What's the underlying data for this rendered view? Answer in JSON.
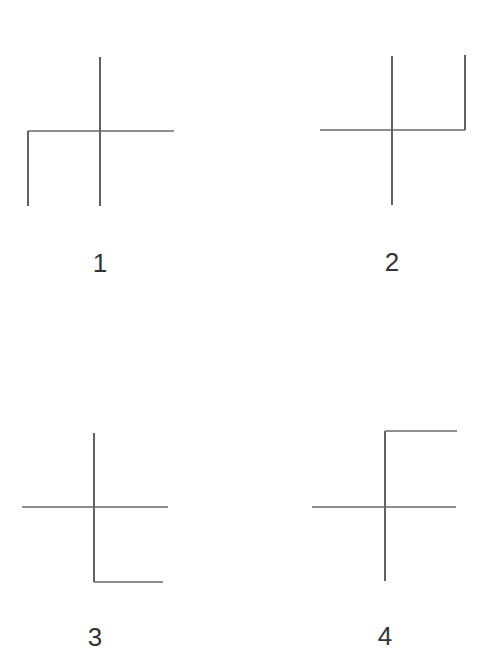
{
  "figures": [
    {
      "label": "1",
      "description": "cross with left leg descending from left end of horizontal bar",
      "lines": [
        {
          "x1": 100,
          "y1": 57,
          "x2": 100,
          "y2": 206
        },
        {
          "x1": 28,
          "y1": 131,
          "x2": 174,
          "y2": 131
        },
        {
          "x1": 28,
          "y1": 131,
          "x2": 28,
          "y2": 206
        }
      ],
      "label_pos": {
        "x": 100,
        "y": 263
      }
    },
    {
      "label": "2",
      "description": "cross with right leg ascending from right end of horizontal bar",
      "lines": [
        {
          "x1": 392,
          "y1": 56,
          "x2": 392,
          "y2": 205
        },
        {
          "x1": 320,
          "y1": 130,
          "x2": 465,
          "y2": 130
        },
        {
          "x1": 465,
          "y1": 55,
          "x2": 465,
          "y2": 130
        }
      ],
      "label_pos": {
        "x": 392,
        "y": 262
      }
    },
    {
      "label": "3",
      "description": "cross with foot extending right from bottom of vertical bar",
      "lines": [
        {
          "x1": 94,
          "y1": 433,
          "x2": 94,
          "y2": 582
        },
        {
          "x1": 22,
          "y1": 507,
          "x2": 168,
          "y2": 507
        },
        {
          "x1": 94,
          "y1": 582,
          "x2": 163,
          "y2": 582
        }
      ],
      "label_pos": {
        "x": 95,
        "y": 637
      }
    },
    {
      "label": "4",
      "description": "cross with arm extending right from top of vertical bar",
      "lines": [
        {
          "x1": 385,
          "y1": 431,
          "x2": 385,
          "y2": 581
        },
        {
          "x1": 312,
          "y1": 507,
          "x2": 456,
          "y2": 507
        },
        {
          "x1": 385,
          "y1": 431,
          "x2": 457,
          "y2": 431
        }
      ],
      "label_pos": {
        "x": 385,
        "y": 636
      }
    }
  ],
  "colors": {
    "background": "#ffffff",
    "stroke": "#3a3a3a",
    "text": "#333333"
  }
}
